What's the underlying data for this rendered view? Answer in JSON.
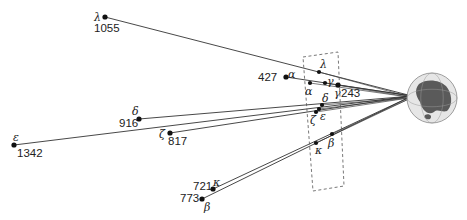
{
  "diagram": {
    "title": "",
    "earth": {
      "cx": 432,
      "cy": 98,
      "r": 25,
      "ocean": "#e6e6e6",
      "land": "#5a5a5a"
    },
    "stars": [
      {
        "name": "λ",
        "id": "lambda",
        "distance": "1055",
        "x": 105,
        "y": 17,
        "nameX": 94,
        "nameY": 21,
        "distX": 94,
        "distY": 32,
        "proj": {
          "x": 319,
          "y": 72,
          "lx": 320,
          "ly": 68
        }
      },
      {
        "name": "α",
        "id": "alpha",
        "distance": "427",
        "x": 286,
        "y": 77,
        "nameX": 288,
        "nameY": 78,
        "distX": 258,
        "distY": 81,
        "proj": {
          "x": 310,
          "y": 83,
          "lx": 305,
          "ly": 95
        }
      },
      {
        "name": "γ",
        "id": "gamma",
        "distance": "243",
        "x": 338,
        "y": 85,
        "nameX": 334,
        "nameY": 97,
        "distX": 341,
        "distY": 97,
        "proj": {
          "x": 325,
          "y": 83,
          "lx": 327,
          "ly": 85
        }
      },
      {
        "name": "δ",
        "id": "delta",
        "distance": "916",
        "x": 139,
        "y": 119,
        "nameX": 132,
        "nameY": 115,
        "distX": 119,
        "distY": 127,
        "proj": {
          "x": 322,
          "y": 105,
          "lx": 322,
          "ly": 102
        }
      },
      {
        "name": "ε",
        "id": "epsilon",
        "distance": "1342",
        "x": 14,
        "y": 145,
        "nameX": 13,
        "nameY": 141,
        "distX": 17,
        "distY": 157,
        "proj": {
          "x": 319,
          "y": 109,
          "lx": 320,
          "ly": 120
        }
      },
      {
        "name": "ζ",
        "id": "zeta",
        "distance": "817",
        "x": 170,
        "y": 133,
        "nameX": 159,
        "nameY": 138,
        "distX": 168,
        "distY": 145,
        "proj": {
          "x": 316,
          "y": 112,
          "lx": 310,
          "ly": 124
        }
      },
      {
        "name": "κ",
        "id": "kappa",
        "distance": "721",
        "x": 213,
        "y": 189,
        "nameX": 213,
        "nameY": 186,
        "distX": 193,
        "distY": 190,
        "proj": {
          "x": 316,
          "y": 143,
          "lx": 315,
          "ly": 154
        }
      },
      {
        "name": "β",
        "id": "beta",
        "distance": "773",
        "x": 202,
        "y": 199,
        "nameX": 204,
        "nameY": 211,
        "distX": 180,
        "distY": 202,
        "proj": {
          "x": 332,
          "y": 134,
          "lx": 328,
          "ly": 147
        }
      }
    ],
    "projection_box": {
      "points": "303,57 338,52 344,186 313,191"
    }
  }
}
